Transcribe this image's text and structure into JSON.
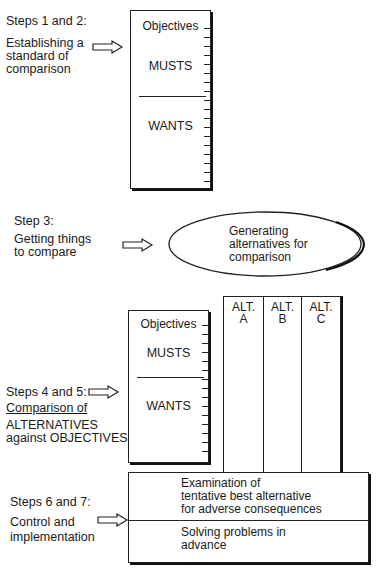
{
  "section1": {
    "step": "Steps 1 and 2:",
    "desc": [
      "Establishing a",
      "standard of",
      "comparison"
    ],
    "box": {
      "header": "Objectives",
      "musts": "MUSTS",
      "wants": "WANTS"
    }
  },
  "section2": {
    "step": "Step 3:",
    "desc": [
      "Getting things",
      "to compare"
    ],
    "ellipse": [
      "Generating",
      "alternatives for",
      "comparison"
    ]
  },
  "section3": {
    "step": "Steps 4 and 5:",
    "desc": [
      "Comparison of",
      "ALTERNATIVES",
      "against OBJECTIVES"
    ],
    "box": {
      "header": "Objectives",
      "musts": "MUSTS",
      "wants": "WANTS"
    },
    "alternatives": [
      {
        "line1": "ALT.",
        "line2": "A"
      },
      {
        "line1": "ALT.",
        "line2": "B"
      },
      {
        "line1": "ALT.",
        "line2": "C"
      }
    ]
  },
  "section4": {
    "step": "Steps 6 and 7:",
    "desc": [
      "Control and",
      "implementation"
    ],
    "box": {
      "top": [
        "Examination of",
        "tentative best alternative",
        "for adverse consequences"
      ],
      "bottom": [
        "Solving problems in",
        "advance"
      ]
    }
  },
  "icons": {
    "arrow": "hollow-right-arrow-icon"
  }
}
